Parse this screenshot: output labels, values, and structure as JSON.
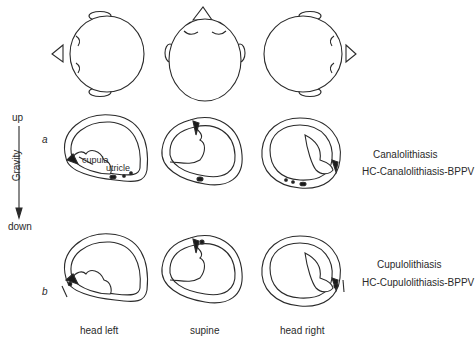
{
  "gravity_axis": {
    "top_label": "up",
    "bottom_label": "down",
    "axis_label": "Gravity"
  },
  "rows": [
    {
      "marker": "a",
      "title": "Canalolithiasis",
      "subtitle": "HC-Canalolithiasis-BPPV",
      "annotations": [
        "cupula",
        "utricle"
      ]
    },
    {
      "marker": "b",
      "title": "Cupulolithiasis",
      "subtitle": "HC-Cupulolithiasis-BPPV"
    }
  ],
  "columns": [
    {
      "label": "head left"
    },
    {
      "label": "supine"
    },
    {
      "label": "head right"
    }
  ],
  "colors": {
    "stroke": "#2a2a2a",
    "fill": "#ffffff",
    "cupula": "#1a1a1a"
  }
}
